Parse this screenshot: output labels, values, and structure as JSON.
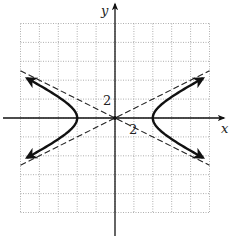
{
  "chart_data": {
    "type": "line",
    "title": "",
    "xlabel": "x",
    "ylabel": "y",
    "xlim": [
      -10,
      10
    ],
    "ylim": [
      -10,
      10
    ],
    "grid": true,
    "grid_step": 2,
    "tick_labels": {
      "x": "2",
      "y": "2"
    },
    "equation": "x^2/16 - y^2/4 = 1",
    "vertices": [
      [
        -4,
        0
      ],
      [
        4,
        0
      ]
    ],
    "center": [
      0,
      0
    ],
    "asymptotes": [
      "y = x/2",
      "y = -x/2"
    ],
    "series": [
      {
        "name": "hyperbola right branch",
        "style": "solid-thick",
        "arrows": true,
        "x": [
          9.3,
          7.0,
          5.7,
          4.6,
          4.0,
          4.6,
          5.7,
          7.0,
          9.3
        ],
        "y": [
          4.2,
          2.9,
          2.0,
          1.1,
          0.0,
          -1.1,
          -2.0,
          -2.9,
          -4.2
        ]
      },
      {
        "name": "hyperbola left branch",
        "style": "solid-thick",
        "arrows": true,
        "x": [
          -9.3,
          -7.0,
          -5.7,
          -4.6,
          -4.0,
          -4.6,
          -5.7,
          -7.0,
          -9.3
        ],
        "y": [
          4.2,
          2.9,
          2.0,
          1.1,
          0.0,
          -1.1,
          -2.0,
          -2.9,
          -4.2
        ]
      },
      {
        "name": "asymptote y = x/2",
        "style": "dashed",
        "x": [
          -10,
          10
        ],
        "y": [
          -5,
          5
        ]
      },
      {
        "name": "asymptote y = -x/2",
        "style": "dashed",
        "x": [
          -10,
          10
        ],
        "y": [
          5,
          -5
        ]
      }
    ]
  },
  "colors": {
    "curve": "#111111",
    "axis": "#111111",
    "grid": "#9a9a9a",
    "asymptote": "#222222"
  }
}
